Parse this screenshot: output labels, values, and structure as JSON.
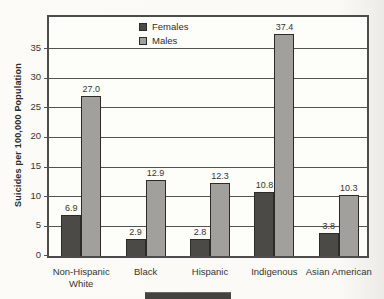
{
  "chart_data": {
    "type": "bar",
    "title": "",
    "categories": [
      "Non-Hispanic White",
      "Black",
      "Hispanic",
      "Indigenous",
      "Asian American"
    ],
    "series": [
      {
        "name": "Females",
        "color": "#4c4a47",
        "values": [
          6.9,
          2.9,
          2.8,
          10.8,
          3.8
        ]
      },
      {
        "name": "Males",
        "color": "#a1a09c",
        "values": [
          27.0,
          12.9,
          12.3,
          37.4,
          10.3
        ]
      }
    ],
    "xlabel": "",
    "ylabel": "Suicides per 100,000 Population",
    "yticks": [
      0,
      5,
      10,
      15,
      20,
      25,
      30,
      35
    ],
    "ylim": [
      0,
      41
    ],
    "grid": true,
    "legend_position": "top-center",
    "value_label_decimals": 1
  },
  "colors": {
    "axis": "#4d4c4a",
    "text": "#2e2d2b",
    "plot_background": "#fdfdfa",
    "page_background": "#fbfaf6",
    "bottom_bar": "#45433f"
  }
}
